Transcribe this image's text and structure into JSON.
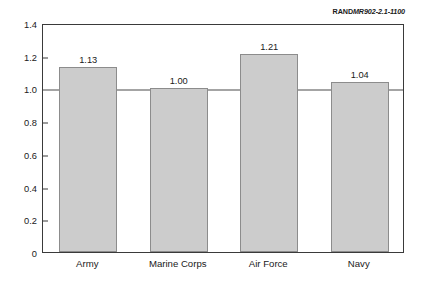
{
  "source_note": {
    "brand": "RAND",
    "document_id": "MR902-2.1-1100"
  },
  "chart_data": {
    "type": "bar",
    "title": "",
    "subtitle": "",
    "xlabel": "",
    "ylabel": "",
    "categories": [
      "Army",
      "Marine Corps",
      "Air Force",
      "Navy"
    ],
    "values": [
      1.13,
      1.0,
      1.21,
      1.04
    ],
    "value_labels": [
      "1.13",
      "1.00",
      "1.21",
      "1.04"
    ],
    "ylim": [
      0,
      1.4
    ],
    "ytick_values": [
      0,
      0.2,
      0.4,
      0.6,
      0.8,
      1.0,
      1.2,
      1.4
    ],
    "ytick_labels": [
      "0",
      "0.2",
      "0.4",
      "0.6",
      "0.8",
      "1.0",
      "1.2",
      "1.4"
    ],
    "grid": false,
    "legend": "none",
    "reference_line": 1.0,
    "bar_color": "#cccccc",
    "bar_edge_color": "#8c8c8c",
    "axis_color": "#3a3a3a",
    "background_color": "#ffffff"
  }
}
